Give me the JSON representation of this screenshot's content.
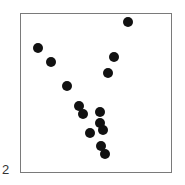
{
  "panel": {
    "label": "2"
  },
  "chart_data": {
    "type": "scatter",
    "title": "",
    "xlabel": "",
    "ylabel": "",
    "grid": false,
    "legend": null,
    "marker_color": "#111111",
    "points_pixel": [
      {
        "x": 128,
        "y": 22
      },
      {
        "x": 38,
        "y": 48
      },
      {
        "x": 51,
        "y": 62
      },
      {
        "x": 114,
        "y": 57
      },
      {
        "x": 108,
        "y": 73
      },
      {
        "x": 67,
        "y": 86
      },
      {
        "x": 79,
        "y": 106
      },
      {
        "x": 83,
        "y": 114
      },
      {
        "x": 100,
        "y": 112
      },
      {
        "x": 100,
        "y": 123
      },
      {
        "x": 103,
        "y": 130
      },
      {
        "x": 90,
        "y": 133
      },
      {
        "x": 101,
        "y": 146
      },
      {
        "x": 105,
        "y": 154
      }
    ],
    "points_normalized": [
      {
        "x": 0.71,
        "y": 0.95
      },
      {
        "x": 0.12,
        "y": 0.79
      },
      {
        "x": 0.2,
        "y": 0.7
      },
      {
        "x": 0.62,
        "y": 0.73
      },
      {
        "x": 0.58,
        "y": 0.63
      },
      {
        "x": 0.31,
        "y": 0.55
      },
      {
        "x": 0.39,
        "y": 0.42
      },
      {
        "x": 0.41,
        "y": 0.37
      },
      {
        "x": 0.53,
        "y": 0.38
      },
      {
        "x": 0.53,
        "y": 0.31
      },
      {
        "x": 0.55,
        "y": 0.27
      },
      {
        "x": 0.46,
        "y": 0.25
      },
      {
        "x": 0.53,
        "y": 0.17
      },
      {
        "x": 0.56,
        "y": 0.12
      }
    ],
    "xlim": [
      0,
      1
    ],
    "ylim": [
      0,
      1
    ]
  }
}
